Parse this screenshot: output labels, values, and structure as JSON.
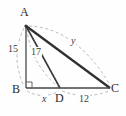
{
  "figure": {
    "type": "geometry-diagram",
    "background_color": "#fefefe",
    "stroke_color": "#333333",
    "dash_color": "#9a9a9a",
    "vertices": [
      {
        "name": "A",
        "label": "A",
        "x": 26,
        "y": 26,
        "label_x": 21,
        "label_y": 8
      },
      {
        "name": "B",
        "label": "B",
        "x": 26,
        "y": 88,
        "label_x": 13,
        "label_y": 87
      },
      {
        "name": "C",
        "label": "C",
        "x": 110,
        "y": 88,
        "label_x": 112,
        "label_y": 85
      },
      {
        "name": "D",
        "label": "D",
        "x": 60,
        "y": 88,
        "label_x": 56,
        "label_y": 94
      }
    ],
    "segments": [
      {
        "name": "AB",
        "from": "A",
        "to": "B",
        "style": "solid"
      },
      {
        "name": "AD",
        "from": "A",
        "to": "D",
        "style": "solid"
      },
      {
        "name": "AC",
        "from": "A",
        "to": "C",
        "style": "solid"
      },
      {
        "name": "BC",
        "from": "B",
        "to": "C",
        "style": "solid"
      }
    ],
    "right_angle": {
      "at": "B",
      "size": 6
    },
    "measures": [
      {
        "name": "AB",
        "label": "15",
        "italic": false,
        "x": 8,
        "y": 50
      },
      {
        "name": "AD",
        "label": "17",
        "italic": false,
        "x": 31,
        "y": 50
      },
      {
        "name": "AC",
        "label": "y",
        "italic": true,
        "x": 70,
        "y": 37
      },
      {
        "name": "BD",
        "label": "x",
        "italic": true,
        "x": 41,
        "y": 95
      },
      {
        "name": "DC",
        "label": "12",
        "italic": false,
        "x": 79,
        "y": 95
      }
    ]
  }
}
